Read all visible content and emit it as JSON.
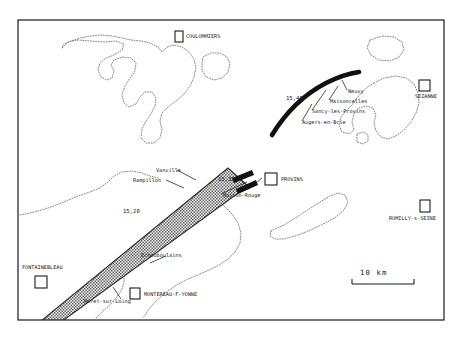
{
  "map": {
    "title": "Eclipse path map - Fontainebleau / Provins / Sezanne region",
    "frame": {
      "x": 18,
      "y": 20,
      "w": 426,
      "h": 300
    },
    "colors": {
      "frame": "#1a1a1a",
      "band_fill": "#8c8c8c",
      "band_edge": "#1a1a1a",
      "arc": "#111111",
      "coastline": "#7a7a7a",
      "text": "#1a1a1a",
      "background": "#ffffff"
    },
    "scale_bar": {
      "label": "10 km",
      "length_px": 62
    },
    "cities": [
      {
        "name": "COULOMMIERS",
        "marker_x": 175,
        "marker_y": 31,
        "label_x": 186,
        "label_y": 34,
        "marker_w": 8,
        "marker_h": 11
      },
      {
        "name": "SEZANNE",
        "marker_x": 419,
        "marker_y": 80,
        "label_x": 415,
        "label_y": 94,
        "marker_w": 11,
        "marker_h": 11
      },
      {
        "name": "PROVINS",
        "marker_x": 265,
        "marker_y": 173,
        "label_x": 279,
        "label_y": 180,
        "marker_w": 12,
        "marker_h": 12
      },
      {
        "name": "ROMILLY-s-SEINE",
        "marker_x": 420,
        "marker_y": 200,
        "label_x": 393,
        "label_y": 216,
        "marker_w": 10,
        "marker_h": 12
      },
      {
        "name": "FONTAINEBLEAU",
        "marker_x": 35,
        "marker_y": 276,
        "label_x": 22,
        "label_y": 266,
        "marker_w": 12,
        "marker_h": 12
      },
      {
        "name": "MONTEREAU-F-YONNE",
        "marker_x": 130,
        "marker_y": 288,
        "label_x": 144,
        "label_y": 294,
        "marker_w": 10,
        "marker_h": 11
      }
    ],
    "towns": [
      {
        "name": "Neuvy",
        "label_x": 348,
        "label_y": 93
      },
      {
        "name": "Maisoncelles",
        "label_x": 330,
        "label_y": 103
      },
      {
        "name": "Sancy-les-Provins",
        "label_x": 313,
        "label_y": 113
      },
      {
        "name": "Augers-en-Brie",
        "label_x": 303,
        "label_y": 124
      },
      {
        "name": "Vanville",
        "label_x": 155,
        "label_y": 172
      },
      {
        "name": "Rampillon",
        "label_x": 133,
        "label_y": 182
      },
      {
        "name": "Maison-Rouge",
        "label_x": 222,
        "label_y": 197
      },
      {
        "name": "Echouboulains",
        "label_x": 140,
        "label_y": 257
      },
      {
        "name": "Moret-sur-Loing",
        "label_x": 85,
        "label_y": 303
      }
    ],
    "time_marks": [
      {
        "value": "15,45",
        "label_x": 286,
        "label_y": 99
      },
      {
        "value": "15,30",
        "label_x": 218,
        "label_y": 181
      },
      {
        "value": "15,20",
        "label_x": 123,
        "label_y": 212
      }
    ]
  }
}
